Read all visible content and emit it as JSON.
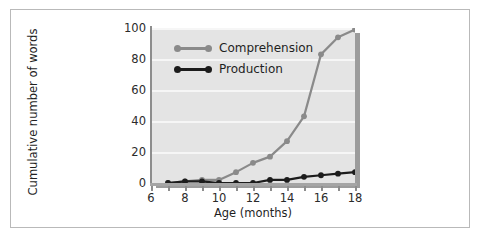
{
  "chart_data": {
    "type": "line",
    "title": "",
    "xlabel": "Age (months)",
    "ylabel": "Cumulative number of words",
    "xlim": [
      6,
      18
    ],
    "ylim": [
      0,
      100
    ],
    "xticks": [
      6,
      7,
      8,
      9,
      10,
      11,
      12,
      13,
      14,
      15,
      16,
      17,
      18
    ],
    "xtick_labels": [
      "6",
      "",
      "8",
      "",
      "10",
      "",
      "12",
      "",
      "14",
      "",
      "16",
      "",
      "18"
    ],
    "yticks": [
      0,
      20,
      40,
      60,
      80,
      100
    ],
    "ytick_labels": [
      "0",
      "20",
      "40",
      "60",
      "80",
      "100"
    ],
    "grid": "horizontal",
    "legend_position": "upper-left-inside",
    "plot_background": "#e4e4e4",
    "gridline_color": "#f6f6f6",
    "x": [
      7,
      8,
      9,
      10,
      11,
      12,
      13,
      14,
      15,
      16,
      17,
      18
    ],
    "series": [
      {
        "name": "Comprehension",
        "color": "#8a8a8a",
        "values": [
          0,
          1,
          2,
          2,
          7,
          13,
          17,
          27,
          43,
          83,
          94,
          99
        ]
      },
      {
        "name": "Production",
        "color": "#1c1c1c",
        "values": [
          0,
          1,
          1,
          0,
          0,
          0,
          2,
          2,
          4,
          5,
          6,
          7
        ]
      }
    ]
  },
  "legend": {
    "items": [
      {
        "label": "Comprehension",
        "color": "#8a8a8a"
      },
      {
        "label": "Production",
        "color": "#1c1c1c"
      }
    ]
  },
  "axes": {
    "x_title": "Age (months)",
    "y_title": "Cumulative number of words"
  }
}
